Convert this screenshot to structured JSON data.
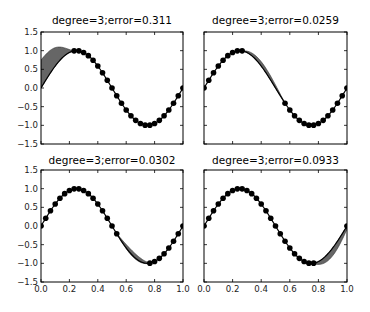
{
  "chart_data": [
    {
      "type": "line",
      "title": "degree=3;error=0.311",
      "xlabel": "",
      "ylabel": "",
      "xlim": [
        0.0,
        1.0
      ],
      "ylim": [
        -1.5,
        1.5
      ],
      "xticks": [
        "0.0",
        "0.2",
        "0.4",
        "0.6",
        "0.8",
        "1.0"
      ],
      "yticks": [
        "-1.5",
        "-1.0",
        "-0.5",
        "0.0",
        "0.5",
        "1.0",
        "1.5"
      ],
      "show_xticklabels": false,
      "show_yticklabels": true,
      "series": [
        {
          "name": "true function",
          "function": "sin(2*pi*x)",
          "style": "line+markers",
          "marker_spacing": 0.0333
        },
        {
          "name": "cubic fit band",
          "style": "filled",
          "x_range": [
            0.0,
            0.23
          ],
          "upper_start": 0.75,
          "upper_peak": 1.3
        }
      ],
      "gap_region": [
        0.0,
        0.23
      ],
      "error": 0.311,
      "degree": 3
    },
    {
      "type": "line",
      "title": "degree=3;error=0.0259",
      "xlim": [
        0.0,
        1.0
      ],
      "ylim": [
        -1.5,
        1.5
      ],
      "xticks": [
        "0.0",
        "0.2",
        "0.4",
        "0.6",
        "0.8",
        "1.0"
      ],
      "yticks": [
        "-1.5",
        "-1.0",
        "-0.5",
        "0.0",
        "0.5",
        "1.0",
        "1.5"
      ],
      "show_xticklabels": false,
      "show_yticklabels": false,
      "series": [
        {
          "name": "true function",
          "function": "sin(2*pi*x)",
          "style": "line+markers"
        },
        {
          "name": "cubic fit band",
          "style": "filled",
          "x_range": [
            0.27,
            0.57
          ]
        }
      ],
      "gap_region": [
        0.27,
        0.57
      ],
      "error": 0.0259,
      "degree": 3
    },
    {
      "type": "line",
      "title": "degree=3;error=0.0302",
      "xlim": [
        0.0,
        1.0
      ],
      "ylim": [
        -1.5,
        1.5
      ],
      "xticks": [
        "0.0",
        "0.2",
        "0.4",
        "0.6",
        "0.8",
        "1.0"
      ],
      "yticks": [
        "-1.5",
        "-1.0",
        "-0.5",
        "0.0",
        "0.5",
        "1.0",
        "1.5"
      ],
      "show_xticklabels": true,
      "show_yticklabels": true,
      "series": [
        {
          "name": "true function",
          "function": "sin(2*pi*x)",
          "style": "line+markers"
        },
        {
          "name": "cubic fit band",
          "style": "filled",
          "x_range": [
            0.53,
            0.77
          ]
        }
      ],
      "gap_region": [
        0.53,
        0.77
      ],
      "error": 0.0302,
      "degree": 3
    },
    {
      "type": "line",
      "title": "degree=3;error=0.0933",
      "xlim": [
        0.0,
        1.0
      ],
      "ylim": [
        -1.5,
        1.5
      ],
      "xticks": [
        "0.0",
        "0.2",
        "0.4",
        "0.6",
        "0.8",
        "1.0"
      ],
      "yticks": [
        "-1.5",
        "-1.0",
        "-0.5",
        "0.0",
        "0.5",
        "1.0",
        "1.5"
      ],
      "show_xticklabels": true,
      "show_yticklabels": false,
      "series": [
        {
          "name": "true function",
          "function": "sin(2*pi*x)",
          "style": "line+markers"
        },
        {
          "name": "cubic fit band",
          "style": "filled",
          "x_range": [
            0.77,
            1.0
          ]
        }
      ],
      "gap_region": [
        0.77,
        1.0
      ],
      "error": 0.0933,
      "degree": 3
    }
  ],
  "panels": [
    {
      "title": "degree=3;error=0.311",
      "box": [
        41,
        32,
        183,
        144
      ],
      "gap": [
        0.0,
        0.23
      ],
      "band": {
        "dir": "up",
        "amp": 0.38
      }
    },
    {
      "title": "degree=3;error=0.0259",
      "box": [
        204,
        32,
        347,
        144
      ],
      "gap": [
        0.27,
        0.57
      ],
      "band": {
        "dir": "up",
        "amp": 0.12
      }
    },
    {
      "title": "degree=3;error=0.0302",
      "box": [
        41,
        170,
        183,
        282
      ],
      "gap": [
        0.53,
        0.77
      ],
      "band": {
        "dir": "up",
        "amp": 0.13
      }
    },
    {
      "title": "degree=3;error=0.0933",
      "box": [
        204,
        170,
        347,
        282
      ],
      "gap": [
        0.77,
        1.0
      ],
      "band": {
        "dir": "down",
        "amp": 0.22
      }
    }
  ],
  "colors": {
    "line": "#000000",
    "marker": "#000000",
    "band": "#666666",
    "axes": "#000000"
  }
}
